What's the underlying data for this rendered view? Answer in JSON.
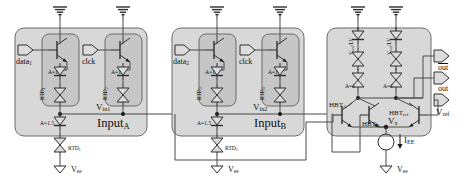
{
  "figure": {
    "background_color": "#ffffff",
    "block_fill": "#d8d8d8",
    "inner_fill": "#c9c9c9",
    "line_color": "#4a4a4a",
    "text_color": "#111111"
  },
  "blocks": {
    "input_a": {
      "label": "Input",
      "subscript": "A"
    },
    "input_b": {
      "label": "Input",
      "subscript": "B"
    },
    "driver": {
      "label": ""
    }
  },
  "input_a": {
    "data_port": {
      "label": "data",
      "subscript": "1"
    },
    "clock_port": {
      "label": "clck",
      "subscript": ""
    },
    "rtd_left": {
      "label": "RTD",
      "subscript": "1"
    },
    "rtd_right": {
      "label": "RTD",
      "subscript": "2"
    },
    "area_left": "A=1",
    "area_right": "A=1",
    "area_bottom": "A=1.5",
    "rtd_bottom": {
      "label": "RTD",
      "subscript": "1"
    },
    "node_label": {
      "label": "V",
      "subscript": "in1"
    },
    "supply_bottom": {
      "label": "V",
      "subscript": "ee"
    }
  },
  "input_b": {
    "data_port": {
      "label": "data",
      "subscript": "2"
    },
    "clock_port": {
      "label": "clck",
      "subscript": ""
    },
    "rtd_left": {
      "label": "RTD",
      "subscript": "3"
    },
    "rtd_right": {
      "label": "RTD",
      "subscript": "4"
    },
    "area_left": "A=1",
    "area_right": "A=1",
    "area_bottom": "A=1.5",
    "rtd_bottom": {
      "label": "RTD",
      "subscript": "2"
    },
    "node_label": {
      "label": "V",
      "subscript": "in2"
    },
    "supply_bottom": {
      "label": "V",
      "subscript": "ee"
    }
  },
  "driver": {
    "rtd_left_vert": {
      "label": "V",
      "subscript": "out",
      "suffix": "/LV"
    },
    "rtd_right_vert": {
      "label": "V",
      "subscript": "out",
      "suffix": "/LV"
    },
    "area_left": "A=1",
    "area_right": "A=1",
    "hbt_a": {
      "label": "HBT",
      "subscript": "A"
    },
    "hbt_b": {
      "label": "HBT",
      "subscript": "B"
    },
    "hbt_ref": {
      "label": "HBT",
      "subscript": "ref"
    },
    "node_vx": {
      "label": "V",
      "subscript": "x"
    },
    "current_source": {
      "label": "I",
      "subscript": "EE"
    },
    "supply_bottom": {
      "label": "V",
      "subscript": "ee"
    }
  },
  "outputs": {
    "out_bar": {
      "label": "out",
      "overline": true
    },
    "out": {
      "label": "out",
      "overline": false
    },
    "v_ref": {
      "label": "V",
      "subscript": "ref"
    }
  }
}
